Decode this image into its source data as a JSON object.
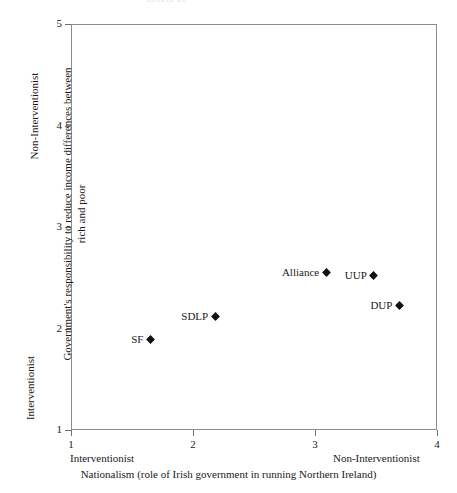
{
  "figure": {
    "cropped_top_text": "xxxxxx xx",
    "marker_color": "#111111",
    "frame_color": "#8d8d8d"
  },
  "chart_data": {
    "type": "scatter",
    "title": "",
    "xlabel": "Nationalism (role of Irish government in running Northern Ireland)",
    "ylabel": "Government's responsibility to reduce income differences between rich and poor",
    "xlim": [
      1,
      4
    ],
    "ylim": [
      1,
      5
    ],
    "xticks": [
      1,
      2,
      3,
      4
    ],
    "xtick_labels": [
      "1",
      "2",
      "3",
      "4"
    ],
    "yticks": [
      1,
      2,
      3,
      4,
      5
    ],
    "ytick_labels": [
      "1",
      "2",
      "3",
      "4",
      "5"
    ],
    "grid": false,
    "legend": "none",
    "x_axis_anchor_low": "Interventionist",
    "x_axis_anchor_high": "Non-Interventionist",
    "y_axis_anchor_low": "Interventionist",
    "y_axis_anchor_high": "Non-Interventionist",
    "points": [
      {
        "label": "SF",
        "x": 1.66,
        "y": 1.88
      },
      {
        "label": "SDLP",
        "x": 2.19,
        "y": 2.11
      },
      {
        "label": "Alliance",
        "x": 3.1,
        "y": 2.54
      },
      {
        "label": "UUP",
        "x": 3.49,
        "y": 2.51
      },
      {
        "label": "DUP",
        "x": 3.7,
        "y": 2.22
      }
    ]
  }
}
